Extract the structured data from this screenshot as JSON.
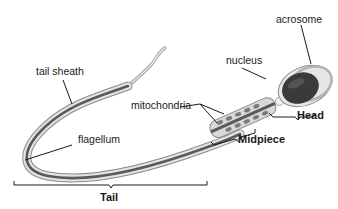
{
  "diagram": {
    "labels": {
      "tail_sheath": "tail sheath",
      "flagellum": "flagellum",
      "mitochondria": "mitochondria",
      "nucleus": "nucleus",
      "acrosome": "acrosome"
    },
    "regions": {
      "tail": "Tail",
      "midpiece": "Midpiece",
      "head": "Head"
    },
    "colors": {
      "background": "#ffffff",
      "outer_membrane": "#e8e8e8",
      "core": "#555555",
      "nucleus": "#3a3a3a",
      "mitochondria": "#7a7a7a",
      "leader_line": "#1a1a1a"
    }
  }
}
